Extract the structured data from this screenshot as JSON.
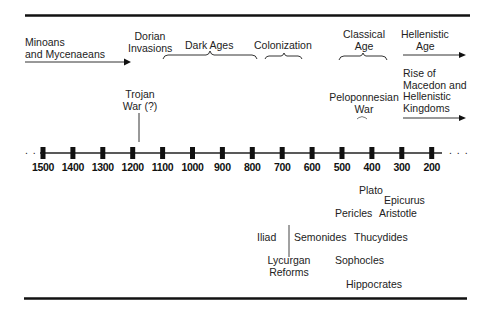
{
  "timeline": {
    "ticks": [
      "1500",
      "1400",
      "1300",
      "1200",
      "1100",
      "1000",
      "900",
      "800",
      "700",
      "600",
      "500",
      "400",
      "300",
      "200"
    ],
    "leading_ellipsis": ". . .",
    "trailing_ellipsis": ". . ."
  },
  "periods": {
    "minoans": {
      "line1": "Minoans",
      "line2": "and Mycenaeans"
    },
    "dorian": {
      "line1": "Dorian",
      "line2": "Invasions"
    },
    "dark_ages": "Dark Ages",
    "colonization": "Colonization",
    "classical": {
      "line1": "Classical",
      "line2": "Age"
    },
    "hellenistic": {
      "line1": "Hellenistic",
      "line2": "Age"
    }
  },
  "events": {
    "trojan_war": {
      "line1": "Trojan",
      "line2": "War (?)"
    },
    "peloponnesian_war": {
      "line1": "Peloponnesian",
      "line2": "War"
    },
    "macedon": {
      "line1": "Rise of",
      "line2": "Macedon and",
      "line3": "Hellenistic",
      "line4": "Kingdoms"
    }
  },
  "figures": {
    "plato": "Plato",
    "epicurus": "Epicurus",
    "pericles": "Pericles",
    "aristotle": "Aristotle",
    "iliad": "Iliad",
    "semonides": "Semonides",
    "thucydides": "Thucydides",
    "lycurgan": {
      "line1": "Lycurgan",
      "line2": "Reforms"
    },
    "sophocles": "Sophocles",
    "hippocrates": "Hippocrates"
  }
}
